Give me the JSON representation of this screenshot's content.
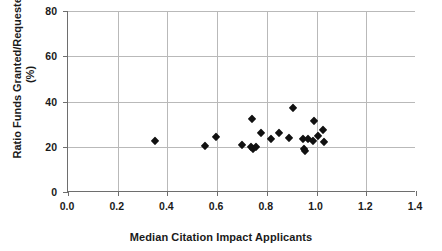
{
  "chart_data": {
    "type": "scatter",
    "title": "",
    "xlabel": "Median Citation Impact Applicants",
    "ylabel": "Ratio Funds Granted/Requested (%)",
    "ylabel_line1": "Ratio Funds Granted/Requested",
    "ylabel_line2": "(%)",
    "xlim": [
      0.0,
      1.4
    ],
    "ylim": [
      0,
      80
    ],
    "xticks": [
      "0.0",
      "0.2",
      "0.4",
      "0.6",
      "0.8",
      "1.0",
      "1.2",
      "1.4"
    ],
    "xtick_values": [
      0.0,
      0.2,
      0.4,
      0.6,
      0.8,
      1.0,
      1.2,
      1.4
    ],
    "yticks": [
      "0",
      "20",
      "40",
      "60",
      "80"
    ],
    "ytick_values": [
      0,
      20,
      40,
      60,
      80
    ],
    "grid": "horizontal-and-vertical",
    "legend": "none",
    "marker": "filled-diamond",
    "marker_color": "#111111",
    "grid_color": "#b9b9b9",
    "axis_color": "#6e6e6e",
    "points": [
      {
        "x": 0.35,
        "y": 22.6
      },
      {
        "x": 0.55,
        "y": 20.2
      },
      {
        "x": 0.595,
        "y": 24.5
      },
      {
        "x": 0.7,
        "y": 20.8
      },
      {
        "x": 0.735,
        "y": 19.8
      },
      {
        "x": 0.74,
        "y": 32.3
      },
      {
        "x": 0.745,
        "y": 18.9
      },
      {
        "x": 0.755,
        "y": 20.0
      },
      {
        "x": 0.775,
        "y": 26.0
      },
      {
        "x": 0.815,
        "y": 23.6
      },
      {
        "x": 0.85,
        "y": 26.2
      },
      {
        "x": 0.89,
        "y": 23.7
      },
      {
        "x": 0.905,
        "y": 37.3
      },
      {
        "x": 0.945,
        "y": 23.4
      },
      {
        "x": 0.95,
        "y": 18.9
      },
      {
        "x": 0.955,
        "y": 18.2
      },
      {
        "x": 0.965,
        "y": 23.3
      },
      {
        "x": 0.985,
        "y": 22.6
      },
      {
        "x": 0.99,
        "y": 31.6
      },
      {
        "x": 1.005,
        "y": 24.6
      },
      {
        "x": 1.025,
        "y": 27.3
      },
      {
        "x": 1.03,
        "y": 21.9
      }
    ]
  },
  "figure": {
    "name": "scatter-plot-funding-ratio-vs-citation-impact"
  }
}
